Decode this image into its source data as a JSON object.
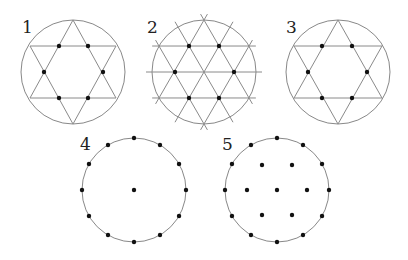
{
  "figures": [
    {
      "id": 1,
      "label": "1",
      "label_pos": [
        22,
        33
      ],
      "circle": {
        "cx": 73,
        "cy": 72,
        "r": 52
      },
      "lines": [
        [
          30,
          46,
          116,
          46
        ],
        [
          30,
          98,
          116,
          98
        ],
        [
          73,
          20,
          30,
          98
        ],
        [
          73,
          20,
          116,
          98
        ],
        [
          73,
          124,
          30,
          46
        ],
        [
          73,
          124,
          116,
          46
        ]
      ],
      "dots": [
        [
          59,
          46
        ],
        [
          88,
          46
        ],
        [
          44,
          72
        ],
        [
          103,
          72
        ],
        [
          59,
          98
        ],
        [
          88,
          98
        ]
      ]
    },
    {
      "id": 2,
      "label": "2",
      "label_pos": [
        147,
        33
      ],
      "circle": {
        "cx": 204,
        "cy": 72,
        "r": 52
      },
      "lines": [
        [
          159,
          46,
          249,
          46
        ],
        [
          152,
          72,
          257,
          72
        ],
        [
          159,
          98,
          249,
          98
        ],
        [
          176,
          20,
          233,
          124
        ],
        [
          204,
          20,
          174,
          72
        ],
        [
          233,
          20,
          204,
          72
        ],
        [
          175,
          20,
          232,
          124
        ],
        [
          233,
          20,
          176,
          124
        ],
        [
          176,
          20,
          233,
          124
        ],
        [
          162,
          20,
          204,
          72
        ],
        [
          246,
          20,
          190,
          124
        ],
        [
          162,
          124,
          219,
          20
        ],
        [
          218,
          124,
          161,
          20
        ]
      ],
      "dots": [
        [
          189,
          46
        ],
        [
          219,
          46
        ],
        [
          175,
          72
        ],
        [
          234,
          72
        ],
        [
          189,
          98
        ],
        [
          219,
          98
        ]
      ]
    },
    {
      "id": 3,
      "label": "3",
      "label_pos": [
        286,
        33
      ],
      "circle": {
        "cx": 338,
        "cy": 72,
        "r": 52
      },
      "lines": [
        [
          294,
          46,
          382,
          46
        ],
        [
          294,
          98,
          382,
          98
        ],
        [
          338,
          20,
          294,
          98
        ],
        [
          338,
          20,
          382,
          98
        ],
        [
          338,
          124,
          294,
          46
        ],
        [
          338,
          124,
          382,
          46
        ]
      ],
      "dots": [
        [
          322,
          46
        ],
        [
          352,
          46
        ],
        [
          308,
          72
        ],
        [
          367,
          72
        ],
        [
          322,
          98
        ],
        [
          352,
          98
        ]
      ]
    },
    {
      "id": 4,
      "label": "4",
      "label_pos": [
        80,
        150
      ],
      "circle": {
        "cx": 134,
        "cy": 190,
        "r": 52
      },
      "points_on_circle": 12,
      "dots": [
        [
          134,
          190
        ]
      ]
    },
    {
      "id": 5,
      "label": "5",
      "label_pos": [
        222,
        150
      ],
      "circle": {
        "cx": 277,
        "cy": 190,
        "r": 52
      },
      "points_on_circle": 12,
      "dots": [
        [
          277,
          190
        ],
        [
          262,
          165
        ],
        [
          292,
          165
        ],
        [
          247,
          190
        ],
        [
          307,
          190
        ],
        [
          262,
          215
        ],
        [
          292,
          215
        ]
      ]
    }
  ]
}
